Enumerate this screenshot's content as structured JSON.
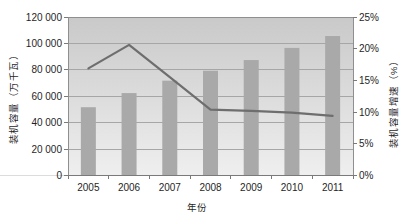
{
  "chart_data": {
    "type": "bar",
    "categories": [
      "2005",
      "2006",
      "2007",
      "2008",
      "2009",
      "2010",
      "2011"
    ],
    "series": [
      {
        "name": "装机容量",
        "type": "bar",
        "axis": "left",
        "values": [
          51700,
          62400,
          71800,
          79300,
          87400,
          96600,
          105600
        ]
      },
      {
        "name": "装机容量增速",
        "type": "line",
        "axis": "right",
        "values": [
          16.9,
          20.6,
          15.5,
          10.4,
          10.2,
          9.9,
          9.4
        ]
      }
    ],
    "title": "",
    "xlabel": "年份",
    "ylabel_left": "装机容量（万千瓦）",
    "ylabel_right": "装机容量增速（%）",
    "ylim_left": [
      0,
      120000
    ],
    "ylim_right": [
      0,
      25
    ],
    "left_tick_labels": [
      "120 000",
      "100 000",
      "80 000",
      "60 000",
      "40 000",
      "20 000",
      "0"
    ],
    "right_tick_labels": [
      "25%",
      "20%",
      "15%",
      "10%",
      "5%",
      "0%"
    ],
    "grid": "horizontal-on",
    "legend": "none",
    "colors": {
      "bar": "#a9a9a9",
      "line": "#6e6e6e",
      "plot_gradient_top": "#c9c9c9",
      "plot_gradient_bottom": "#efefef",
      "gridline": "#a6a6a6",
      "plot_border": "#8f8f8f",
      "axis_line": "#7a7a7a",
      "text": "#1f1f1f",
      "background": "#ffffff"
    }
  }
}
